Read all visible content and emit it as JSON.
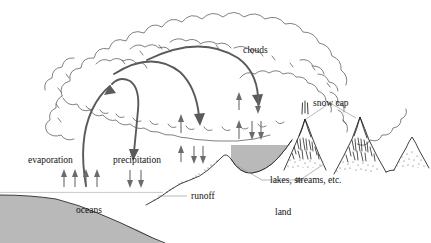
{
  "figure": {
    "type": "diagram",
    "width": 431,
    "height": 243,
    "background_color": "#ffffff"
  },
  "colors": {
    "water_fill": "#b9b9b9",
    "outline": "#2a2a2a",
    "cloud_outline": "#4a4a4a",
    "big_arrow": "#5a5a5a",
    "small_arrow": "#6b6b6b",
    "leader_line": "#9a9a9a",
    "text": "#111111"
  },
  "labels": {
    "clouds": "clouds",
    "snow_cap": "snow cap",
    "evaporation": "evaporation",
    "precipitation": "precipitation",
    "lakes_streams": "lakes, streams, etc.",
    "runoff": "runoff",
    "oceans": "oceans",
    "land": "land"
  },
  "arrow_groups": [
    {
      "name": "evaporation-arrows",
      "direction": "up",
      "count": 4
    },
    {
      "name": "precipitation-arrows",
      "direction": "down",
      "count": 2
    },
    {
      "name": "mid-lower-up-arrows",
      "direction": "up",
      "count": 1
    },
    {
      "name": "mid-lower-down-arrows",
      "direction": "down",
      "count": 2
    },
    {
      "name": "mid-upper-up-arrows",
      "direction": "up",
      "count": 1
    },
    {
      "name": "right-mid-up-arrows",
      "direction": "up",
      "count": 1
    },
    {
      "name": "right-mid-down-arrows",
      "direction": "down",
      "count": 2
    },
    {
      "name": "right-high-up-arrows",
      "direction": "up",
      "count": 1
    },
    {
      "name": "right-high-down-arrows",
      "direction": "down",
      "count": 1
    }
  ],
  "curved_arrows": [
    {
      "name": "evaporation-rising-arc",
      "from": "ocean",
      "to": "cloud",
      "direction": "up"
    },
    {
      "name": "precipitation-falling-arc",
      "from": "cloud",
      "to": "land",
      "direction": "down"
    },
    {
      "name": "cloud-transport-arc-left",
      "from": "cloud-left",
      "to": "cloud-mid",
      "direction": "down-right"
    },
    {
      "name": "cloud-transport-arc-right",
      "from": "cloud-mid",
      "to": "cloud-right",
      "direction": "down-right"
    }
  ],
  "features": [
    {
      "name": "ocean",
      "fill": "#b9b9b9",
      "edge": "serrated"
    },
    {
      "name": "lake",
      "fill": "#b9b9b9"
    },
    {
      "name": "mountain-left",
      "has_snow_cap": true
    },
    {
      "name": "mountain-right",
      "has_snow_cap": true
    },
    {
      "name": "mountain-far-right",
      "has_snow_cap": false
    },
    {
      "name": "cloud-mass",
      "style": "scalloped-outline"
    }
  ]
}
